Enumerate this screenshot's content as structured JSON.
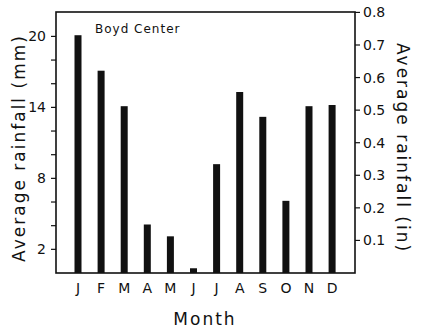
{
  "chart_data": {
    "type": "bar",
    "title": "Boyd Center",
    "xlabel": "Month",
    "ylabel": "Average rainfall (mm)",
    "ylabel_right": "Average rainfall (in)",
    "categories": [
      "J",
      "F",
      "M",
      "A",
      "M",
      "J",
      "J",
      "A",
      "S",
      "O",
      "N",
      "D"
    ],
    "values": [
      20.1,
      17.1,
      14.1,
      4.1,
      3.1,
      0.4,
      9.2,
      15.3,
      13.2,
      6.1,
      14.1,
      14.2
    ],
    "ylim": [
      0,
      22
    ],
    "yticks_left_labeled": [
      2,
      8,
      14,
      20
    ],
    "yticks_left_minor": [
      2,
      4,
      6,
      8,
      10,
      12,
      14,
      16,
      18,
      20
    ],
    "ylim_right": [
      0,
      0.866
    ],
    "yticks_right": [
      0.1,
      0.2,
      0.3,
      0.4,
      0.5,
      0.6,
      0.7,
      0.8
    ],
    "yticks_right_labels": [
      "0.1",
      "0.2",
      "0.3",
      "0.4",
      "0.5",
      "0.6",
      "0.7",
      "0.8"
    ],
    "grid": false,
    "legend": null,
    "bar_color": "#111111"
  }
}
